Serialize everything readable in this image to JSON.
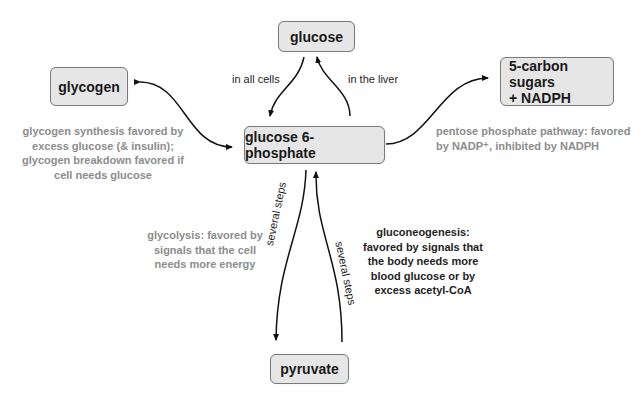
{
  "nodes": {
    "glucose": "glucose",
    "glycogen": "glycogen",
    "g6p": "glucose 6-phosphate",
    "pentose_line1": "5-carbon sugars",
    "pentose_line2": "+ NADPH",
    "pyruvate": "pyruvate"
  },
  "edge_labels": {
    "in_all_cells": "in all cells",
    "in_the_liver": "in the liver",
    "several_steps_down": "several steps",
    "several_steps_up": "several steps"
  },
  "annotations": {
    "glycogen": [
      "glycogen synthesis favored by",
      "excess glucose (& insulin);",
      "glycogen breakdown favored if",
      "cell needs glucose"
    ],
    "pentose": [
      "pentose phosphate pathway: favored",
      "by NADP⁺, inhibited by NADPH"
    ],
    "glycolysis": [
      "glycolysis: favored by",
      "signals that the cell",
      "needs more energy"
    ],
    "gluconeogenesis": [
      "gluconeogenesis:",
      "favored by signals that",
      "the body needs more",
      "blood glucose or by",
      "excess acetyl-CoA"
    ]
  },
  "colors": {
    "node_fill": "#e6e6e6",
    "node_border": "#7a7a7a",
    "gray_text": "#8c8c8c",
    "dark_text": "#1e1e1e"
  }
}
